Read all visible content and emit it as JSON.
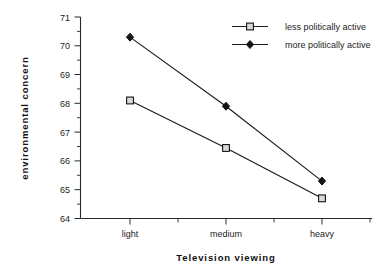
{
  "chart_data": {
    "type": "line",
    "title": "",
    "xlabel": "Television  viewing",
    "ylabel": "environmental  concern",
    "categories": [
      "light",
      "medium",
      "heavy"
    ],
    "ylim": [
      64,
      71
    ],
    "yticks": [
      64,
      65,
      66,
      67,
      68,
      69,
      70,
      71
    ],
    "ytick_labels": [
      "64",
      "65",
      "66",
      "67",
      "68",
      "69",
      "70",
      "71"
    ],
    "minor_ticks": true,
    "grid": false,
    "legend_position": "top-right",
    "series": [
      {
        "name": "less politically active",
        "marker": "open-square",
        "values": [
          68.1,
          66.45,
          64.7
        ]
      },
      {
        "name": "more politically active",
        "marker": "filled-diamond",
        "values": [
          70.3,
          67.9,
          65.3
        ]
      }
    ],
    "colors": {
      "line": "#1a1a1a",
      "marker_open_fill": "#d9d9d9",
      "marker_filled_fill": "#141414",
      "axis": "#2a2a2a",
      "background": "#ffffff"
    }
  },
  "axes": {
    "y_label": "environmental  concern",
    "x_label": "Television  viewing",
    "y_ticks": [
      "71",
      "70",
      "69",
      "68",
      "67",
      "66",
      "65",
      "64"
    ],
    "x_ticks": [
      "light",
      "medium",
      "heavy"
    ]
  },
  "legend": {
    "entries": [
      {
        "label": "less politically active",
        "marker": "open-square"
      },
      {
        "label": "more politically active",
        "marker": "filled-diamond"
      }
    ]
  }
}
